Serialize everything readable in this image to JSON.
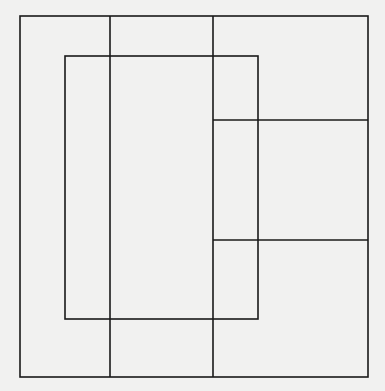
{
  "diagram": {
    "type": "overlapping-rectangles-line-drawing",
    "background_color": "#f1f1f0",
    "stroke_color": "#1a1a1a",
    "stroke_width": 1.6,
    "outer_rect": {
      "x": 20,
      "y": 16,
      "w": 348,
      "h": 361
    },
    "inner_rect": {
      "x": 65,
      "y": 56,
      "w": 193,
      "h": 263
    },
    "vertical_lines": [
      {
        "x": 110,
        "y1": 16,
        "y2": 377
      },
      {
        "x": 213,
        "y1": 16,
        "y2": 377
      }
    ],
    "horizontal_lines": [
      {
        "y": 120,
        "x1": 213,
        "x2": 368
      },
      {
        "y": 240,
        "x1": 213,
        "x2": 368
      }
    ]
  }
}
